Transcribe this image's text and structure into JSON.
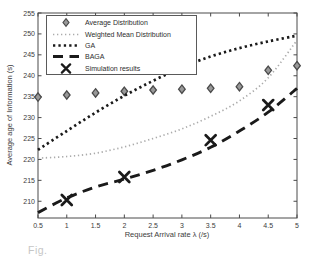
{
  "figure": {
    "caption_fragment": "Fig.",
    "background": "#ffffff",
    "axis_color": "#4a4a4a",
    "text_color": "#3c3c3c"
  },
  "chart_data": {
    "type": "line",
    "title": "",
    "xlabel": "Request Arrival rate λ (/s)",
    "ylabel": "Average age of Information (s)",
    "xlim": [
      0.5,
      5
    ],
    "ylim": [
      206,
      255
    ],
    "grid": false,
    "legend_position": "top-left",
    "xticks": [
      0.5,
      1,
      1.5,
      2,
      2.5,
      3,
      3.5,
      4,
      4.5,
      5
    ],
    "xtick_labels": [
      "0.5",
      "1",
      "1.5",
      "2",
      "2.5",
      "3",
      "3.5",
      "4",
      "4.5",
      "5"
    ],
    "yticks": [
      210,
      215,
      220,
      225,
      230,
      235,
      240,
      245,
      250,
      255
    ],
    "ytick_labels": [
      "210",
      "215",
      "220",
      "225",
      "230",
      "235",
      "240",
      "245",
      "250",
      "255"
    ],
    "x": [
      0.5,
      1,
      1.5,
      2,
      2.5,
      3,
      3.5,
      4,
      4.5,
      5
    ],
    "series": [
      {
        "name": "Average Distribution",
        "kind": "scatter",
        "marker": "diamond",
        "color": "#4a4a4a",
        "fill": "#999999",
        "values": [
          234.9,
          235.4,
          235.9,
          236.3,
          236.6,
          236.8,
          237.0,
          237.4,
          241.3,
          242.4
        ]
      },
      {
        "name": "Weighted Mean Distribution",
        "kind": "line",
        "dash": "dotted-fine",
        "color": "#ababab",
        "values": [
          220.3,
          220.7,
          221.5,
          223.0,
          225.0,
          227.3,
          230.3,
          234.0,
          239.5,
          248.5
        ]
      },
      {
        "name": "GA",
        "kind": "line",
        "dash": "dotted-bold",
        "color": "#1a1a1a",
        "values": [
          222.3,
          226.8,
          231.2,
          235.2,
          238.8,
          242.0,
          244.6,
          246.6,
          248.2,
          249.6
        ]
      },
      {
        "name": "BAGA",
        "kind": "line",
        "dash": "dashed-bold",
        "color": "#1a1a1a",
        "values": [
          207.3,
          210.8,
          213.4,
          215.3,
          217.4,
          219.9,
          222.9,
          226.8,
          231.3,
          237.0
        ]
      },
      {
        "name": "Simulation results",
        "kind": "scatter",
        "marker": "x",
        "color": "#1a1a1a",
        "x": [
          1,
          2,
          3.5,
          4.5
        ],
        "values": [
          210.3,
          215.8,
          224.6,
          233.0
        ]
      }
    ]
  }
}
